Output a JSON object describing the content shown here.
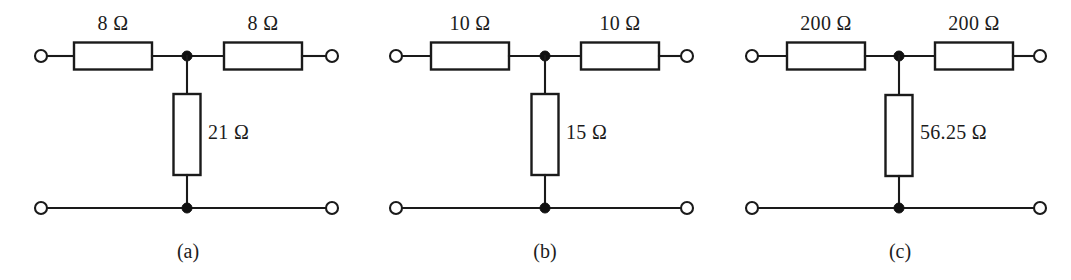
{
  "figure": {
    "type": "circuit-diagram",
    "background_color": "#ffffff",
    "line_color": "#1a1a1a",
    "text_color": "#1c1c1c"
  },
  "circuits": [
    {
      "id": "circuit-a",
      "caption": "(a)",
      "series_left_label": "8 Ω",
      "series_right_label": "8 Ω",
      "shunt_label": "21 Ω",
      "series_left_value": 8,
      "series_right_value": 8,
      "shunt_value": 21,
      "unit": "Ω"
    },
    {
      "id": "circuit-b",
      "caption": "(b)",
      "series_left_label": "10 Ω",
      "series_right_label": "10 Ω",
      "shunt_label": "15 Ω",
      "series_left_value": 10,
      "series_right_value": 10,
      "shunt_value": 15,
      "unit": "Ω"
    },
    {
      "id": "circuit-c",
      "caption": "(c)",
      "series_left_label": "200 Ω",
      "series_right_label": "200 Ω",
      "shunt_label": "56.25 Ω",
      "series_left_value": 200,
      "series_right_value": 200,
      "shunt_value": 56.25,
      "unit": "Ω"
    }
  ]
}
